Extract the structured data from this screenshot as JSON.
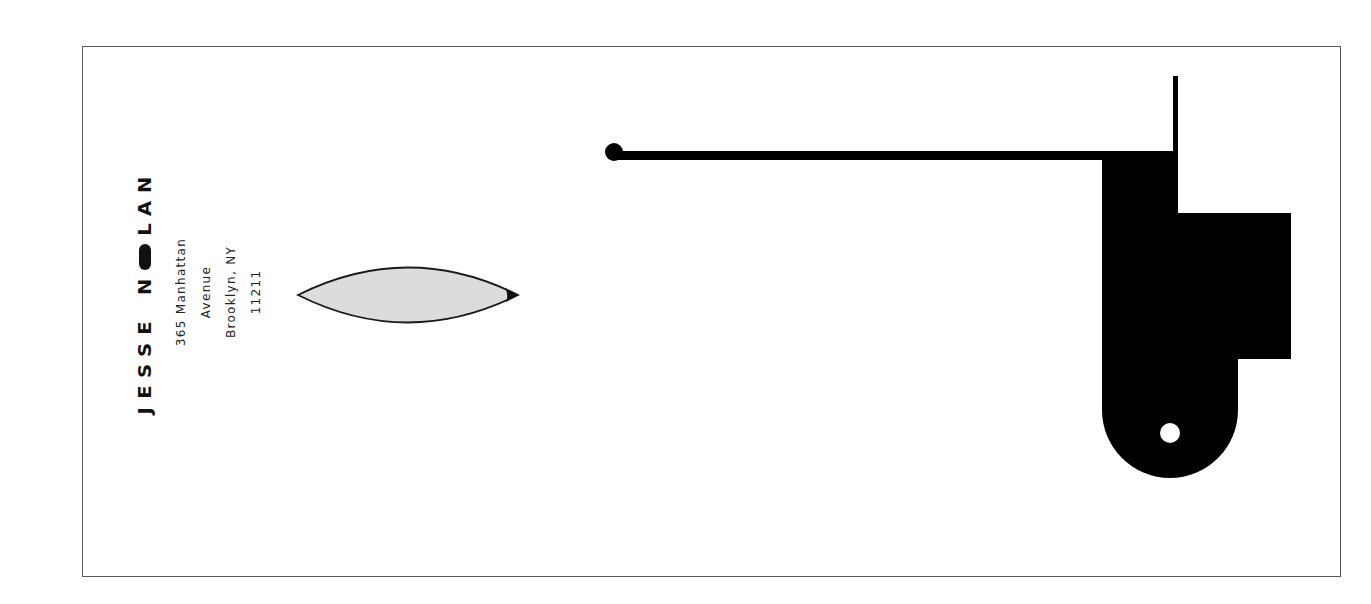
{
  "letterhead": {
    "name": {
      "first": "JESSE",
      "last": "NOLAN",
      "letters_first": [
        "J",
        "E",
        "S",
        "S",
        "E"
      ],
      "letters_last": [
        "N",
        "O",
        "L",
        "A",
        "N"
      ]
    },
    "address": {
      "line1": "365 Manhattan",
      "line2": "Avenue",
      "line3": "Brooklyn, NY",
      "line4": "11211"
    }
  },
  "graphics": {
    "frame_color": "#5a5a5a",
    "leaf_fill": "#dcdcdc",
    "leaf_stroke": "#1a1a1a",
    "shape_color": "#000000",
    "background": "#ffffff",
    "icons": [
      "leaf-lens-icon",
      "key-lever-shape-icon",
      "knob-icon",
      "keyhole-icon"
    ]
  }
}
